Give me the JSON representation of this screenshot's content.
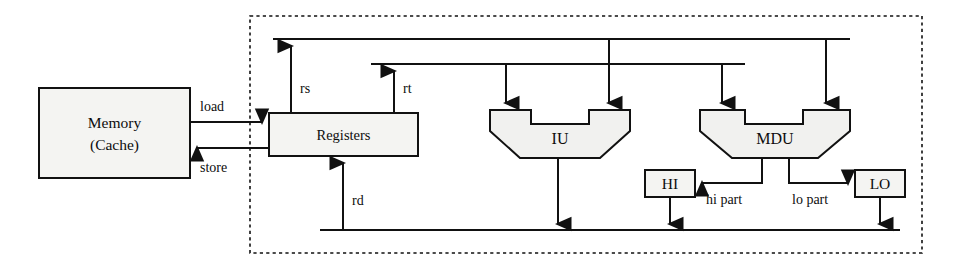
{
  "diagram": {
    "blocks": {
      "memory": {
        "line1": "Memory",
        "line2": "(Cache)"
      },
      "registers": {
        "label": "Registers"
      },
      "iu": {
        "label": "IU"
      },
      "mdu": {
        "label": "MDU"
      },
      "hi": {
        "label": "HI"
      },
      "lo": {
        "label": "LO"
      }
    },
    "edge_labels": {
      "load": "load",
      "store": "store",
      "rs": "rs",
      "rt": "rt",
      "rd": "rd",
      "hi_part": "hi part",
      "lo_part": "lo part"
    },
    "colors": {
      "stroke": "#111111",
      "block_fill": "#f4f4f2",
      "background": "#ffffff",
      "dashed_boundary": "#111111"
    }
  }
}
